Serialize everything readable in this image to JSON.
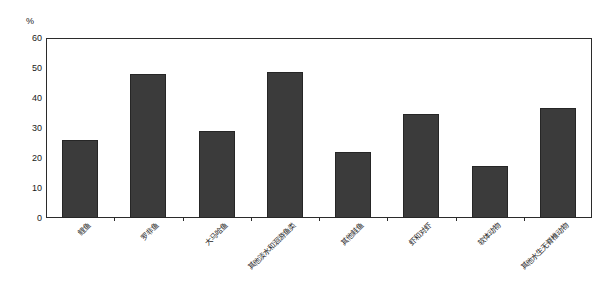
{
  "chart_data": {
    "type": "bar",
    "title": "",
    "subtitle": "",
    "xlabel": "",
    "ylabel": "",
    "yunit": "%",
    "ylim": [
      0,
      60
    ],
    "yticks": [
      0,
      10,
      20,
      30,
      40,
      50,
      60
    ],
    "ytick_labels": [
      "0",
      "10",
      "20",
      "30",
      "40",
      "50",
      "60"
    ],
    "grid": false,
    "legend": null,
    "legend_position": "none",
    "bar_color": "#3b3b3b",
    "bar_edge_color": "#262626",
    "axis_color": "#2b2b2b",
    "categories": [
      "鲤鱼",
      "罗非鱼",
      "大马哈鱼",
      "其他淡水和洄游鱼类",
      "其他鲑鱼",
      "虾和对虾",
      "软体动物",
      "其他水生无脊椎动物"
    ],
    "values": [
      26,
      48,
      29,
      48.7,
      22,
      34.7,
      17.2,
      36.7
    ],
    "series": [
      {
        "name": "",
        "values": [
          26,
          48,
          29,
          48.7,
          22,
          34.7,
          17.2,
          36.7
        ]
      }
    ]
  }
}
